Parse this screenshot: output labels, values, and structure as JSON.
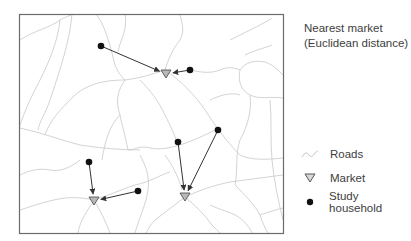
{
  "legend": {
    "title_line1": "Nearest market",
    "title_line2": "(Euclidean distance)",
    "items": [
      {
        "label": "Roads",
        "icon": "road-line-icon"
      },
      {
        "label": "Market",
        "icon": "triangle-down-icon"
      },
      {
        "label": "Study household",
        "icon": "filled-circle-icon"
      }
    ]
  },
  "colors": {
    "frame": "#6b6b6b",
    "roads": "#c8c8c8",
    "market_fill": "#b8b8b8",
    "market_stroke": "#555555",
    "household": "#111111",
    "arrow": "#333333"
  },
  "markets": [
    {
      "id": "m1"
    },
    {
      "id": "m2"
    },
    {
      "id": "m3"
    }
  ],
  "households": [
    {
      "id": "h1",
      "nearest_market": "m1"
    },
    {
      "id": "h2",
      "nearest_market": "m1"
    },
    {
      "id": "h3",
      "nearest_market": "m2"
    },
    {
      "id": "h4",
      "nearest_market": "m2"
    },
    {
      "id": "h5",
      "nearest_market": "m3"
    },
    {
      "id": "h6",
      "nearest_market": "m3"
    }
  ]
}
